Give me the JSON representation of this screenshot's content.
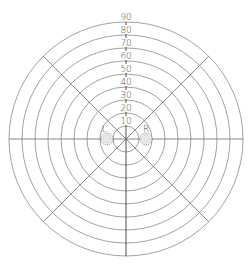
{
  "chart_data": {
    "type": "polar-grid",
    "title": "",
    "center": [
      126,
      139
    ],
    "ring_spacing_px": 13,
    "rings": [
      10,
      20,
      30,
      40,
      50,
      60,
      70,
      80,
      90
    ],
    "ring_labels": [
      "10",
      "20",
      "30",
      "40",
      "50",
      "60",
      "70",
      "80",
      "90"
    ],
    "spoke_angles_deg": [
      0,
      45,
      90,
      135,
      180,
      225,
      270,
      315
    ],
    "markers": [
      {
        "label": "L",
        "x_offset_px": -19,
        "y_offset_px": 0,
        "radius_px": 6
      },
      {
        "label": "R",
        "x_offset_px": 20,
        "y_offset_px": 0,
        "radius_px": 6
      }
    ],
    "grid": true,
    "colors": {
      "ring": "#8a8a8a",
      "spoke": "#6a6a6a",
      "text": "#4a4a4a"
    }
  },
  "labels": {
    "left_eye": "L",
    "right_eye": "R"
  }
}
